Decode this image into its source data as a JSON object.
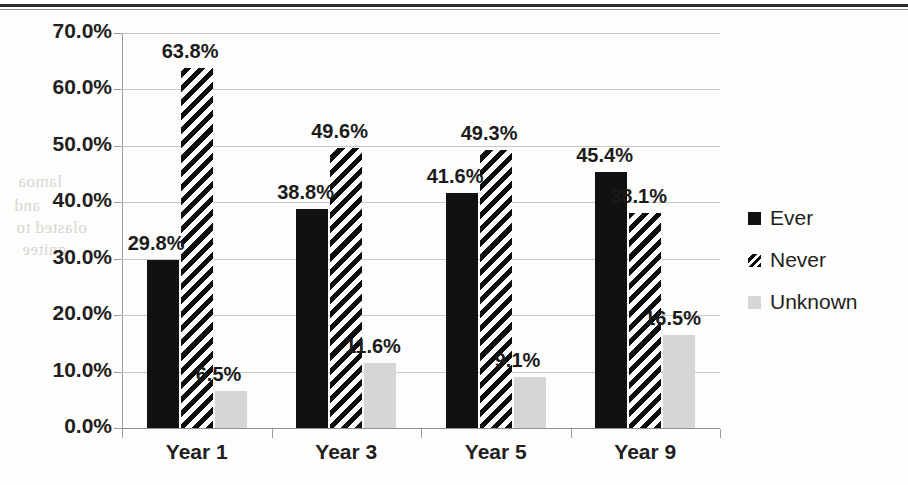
{
  "chart_data": {
    "type": "bar",
    "title": "",
    "subtitle": "",
    "xlabel": "",
    "ylabel": "",
    "categories": [
      "Year 1",
      "Year 3",
      "Year 5",
      "Year 9"
    ],
    "series": [
      {
        "name": "Ever",
        "color": "#111111",
        "pattern": "solid",
        "values": [
          29.8,
          38.8,
          41.6,
          45.4
        ]
      },
      {
        "name": "Never",
        "color": "#0d0d0d",
        "pattern": "diagonal",
        "values": [
          63.8,
          49.6,
          49.3,
          38.1
        ]
      },
      {
        "name": "Unknown",
        "color": "#d6d6d6",
        "pattern": "solid",
        "values": [
          6.5,
          11.6,
          9.1,
          16.5
        ]
      }
    ],
    "data_labels": [
      "29.8%",
      "63.8%",
      "6.5%",
      "38.8%",
      "49.6%",
      "11.6%",
      "41.6%",
      "49.3%",
      "9.1%",
      "45.4%",
      "38.1%",
      "16.5%"
    ],
    "ylim": [
      0,
      70
    ],
    "ytick_labels": [
      "0.0%",
      "10.0%",
      "20.0%",
      "30.0%",
      "40.0%",
      "50.0%",
      "60.0%",
      "70.0%"
    ],
    "ytick_values": [
      0,
      10,
      20,
      30,
      40,
      50,
      60,
      70
    ],
    "grid": true,
    "legend_position": "right"
  },
  "legend": {
    "items": [
      {
        "label": "Ever",
        "swatch": "solid-black-square-icon"
      },
      {
        "label": "Never",
        "swatch": "diagonal-hatch-square-icon"
      },
      {
        "label": "Unknown",
        "swatch": "light-gray-square-icon"
      }
    ]
  },
  "ghost_text": {
    "a": "lamoa",
    "b": "and",
    "c": "olasted to",
    "d": "gnitee",
    "e": "hgraph"
  }
}
